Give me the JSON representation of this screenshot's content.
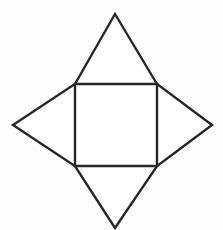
{
  "figure": {
    "background_color": "#fdfdfd",
    "stroke_color": "#262626",
    "fill_color": "#ffffff",
    "stroke_width": 2.4,
    "canvas": {
      "width": 223,
      "height": 230
    },
    "square": {
      "name": "central-square",
      "left": 75,
      "top": 84,
      "right": 157,
      "bottom": 166,
      "width": 82,
      "height": 82
    },
    "apexes": {
      "top": {
        "x": 115,
        "y": 14
      },
      "right": {
        "x": 212,
        "y": 125
      },
      "bottom": {
        "x": 115,
        "y": 228
      },
      "left": {
        "x": 13,
        "y": 125
      }
    },
    "parts": [
      {
        "name": "central-square",
        "label": "Square",
        "points": "75,84 157,84 157,166 75,166"
      },
      {
        "name": "top-triangle",
        "label": "Top triangle",
        "points": "75,84 157,84 115,14"
      },
      {
        "name": "right-triangle",
        "label": "Right triangle",
        "points": "157,84 157,166 212,125"
      },
      {
        "name": "bottom-triangle",
        "label": "Bottom triangle",
        "points": "75,166 157,166 115,228"
      },
      {
        "name": "left-triangle",
        "label": "Left triangle",
        "points": "75,84 75,166 13,125"
      }
    ],
    "outline": {
      "name": "star-outline",
      "points": "115,14 157,84 212,125 157,166 115,228 75,166 13,125 75,84"
    }
  }
}
